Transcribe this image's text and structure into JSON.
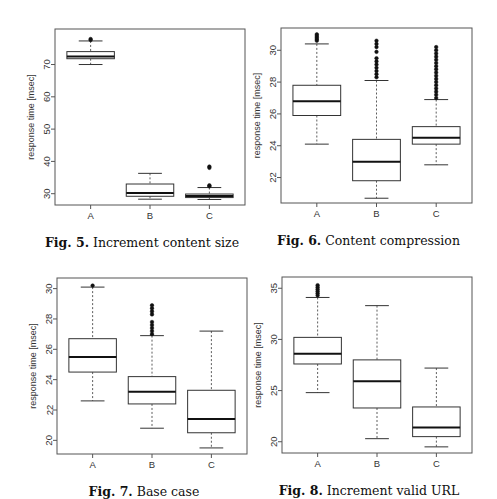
{
  "chart_data": [
    {
      "id": "fig5",
      "type": "box",
      "title": "Increment content size",
      "caption_label": "Fig. 5.",
      "caption_text": "Increment content size",
      "ylabel": "response time [msec]",
      "xlabel": "",
      "categories": [
        "A",
        "B",
        "C"
      ],
      "yticks": [
        30,
        40,
        50,
        60,
        70
      ],
      "ylim": [
        26.5,
        81
      ],
      "grid": false,
      "frame": {
        "x": 55,
        "y": 29,
        "w": 190,
        "h": 176
      },
      "boxes": [
        {
          "name": "A",
          "whisker_low": 70.0,
          "q1": 71.8,
          "median": 72.5,
          "q3": 74.0,
          "whisker_high": 77.3,
          "outliers": [
            77.6,
            77.9
          ]
        },
        {
          "name": "B",
          "whisker_low": 28.3,
          "q1": 29.2,
          "median": 30.2,
          "q3": 33.0,
          "whisker_high": 36.3,
          "outliers": []
        },
        {
          "name": "C",
          "whisker_low": 28.2,
          "q1": 28.8,
          "median": 29.3,
          "q3": 29.9,
          "whisker_high": 31.9,
          "outliers": [
            32.3,
            32.6,
            38.0,
            38.4
          ]
        }
      ]
    },
    {
      "id": "fig6",
      "type": "box",
      "title": "Content compression",
      "caption_label": "Fig. 6.",
      "caption_text": "Content compression",
      "ylabel": "response time [msec]",
      "xlabel": "",
      "categories": [
        "A",
        "B",
        "C"
      ],
      "yticks": [
        22,
        24,
        26,
        28,
        30
      ],
      "ylim": [
        20.4,
        31.4
      ],
      "grid": false,
      "frame": {
        "x": 281,
        "y": 28,
        "w": 191,
        "h": 175
      },
      "boxes": [
        {
          "name": "A",
          "whisker_low": 24.1,
          "q1": 25.9,
          "median": 26.8,
          "q3": 27.8,
          "whisker_high": 30.4,
          "outliers": [
            30.6,
            30.7,
            30.8,
            30.9,
            31.0
          ]
        },
        {
          "name": "B",
          "whisker_low": 20.7,
          "q1": 21.8,
          "median": 23.0,
          "q3": 24.4,
          "whisker_high": 28.1,
          "outliers": [
            28.3,
            28.5,
            28.7,
            28.9,
            29.1,
            29.3,
            29.5,
            29.9,
            30.2,
            30.4,
            30.6
          ]
        },
        {
          "name": "C",
          "whisker_low": 22.8,
          "q1": 24.1,
          "median": 24.5,
          "q3": 25.2,
          "whisker_high": 26.9,
          "outliers": [
            27.0,
            27.2,
            27.4,
            27.6,
            27.8,
            28.0,
            28.2,
            28.4,
            28.6,
            28.8,
            29.0,
            29.2,
            29.4,
            29.6,
            29.8,
            30.0,
            30.2
          ]
        }
      ]
    },
    {
      "id": "fig7",
      "type": "box",
      "title": "Base case",
      "caption_label": "Fig. 7.",
      "caption_text": "Base case",
      "ylabel": "response time [msec]",
      "xlabel": "",
      "categories": [
        "A",
        "B",
        "C"
      ],
      "yticks": [
        20,
        22,
        24,
        26,
        28,
        30
      ],
      "ylim": [
        19.1,
        30.7
      ],
      "grid": false,
      "frame": {
        "x": 57,
        "y": 278,
        "w": 190,
        "h": 176
      },
      "boxes": [
        {
          "name": "A",
          "whisker_low": 22.6,
          "q1": 24.5,
          "median": 25.5,
          "q3": 26.7,
          "whisker_high": 30.1,
          "outliers": [
            30.2
          ]
        },
        {
          "name": "B",
          "whisker_low": 20.8,
          "q1": 22.4,
          "median": 23.2,
          "q3": 24.2,
          "whisker_high": 26.9,
          "outliers": [
            27.0,
            27.2,
            27.4,
            27.6,
            27.8,
            28.3,
            28.5,
            28.7,
            28.9
          ]
        },
        {
          "name": "C",
          "whisker_low": 19.5,
          "q1": 20.5,
          "median": 21.4,
          "q3": 23.3,
          "whisker_high": 27.2,
          "outliers": []
        }
      ]
    },
    {
      "id": "fig8",
      "type": "box",
      "title": "Increment valid URL",
      "caption_label": "Fig. 8.",
      "caption_text": "Increment valid URL",
      "ylabel": "response time [msec]",
      "xlabel": "",
      "categories": [
        "A",
        "B",
        "C"
      ],
      "yticks": [
        20,
        25,
        30,
        35
      ],
      "ylim": [
        18.9,
        36.1
      ],
      "grid": false,
      "frame": {
        "x": 282,
        "y": 277,
        "w": 190,
        "h": 176
      },
      "boxes": [
        {
          "name": "A",
          "whisker_low": 24.8,
          "q1": 27.6,
          "median": 28.6,
          "q3": 30.2,
          "whisker_high": 34.1,
          "outliers": [
            34.3,
            34.5,
            34.7,
            34.9,
            35.1,
            35.3
          ]
        },
        {
          "name": "B",
          "whisker_low": 20.3,
          "q1": 23.3,
          "median": 25.9,
          "q3": 28.0,
          "whisker_high": 33.3,
          "outliers": []
        },
        {
          "name": "C",
          "whisker_low": 19.5,
          "q1": 20.5,
          "median": 21.4,
          "q3": 23.4,
          "whisker_high": 27.2,
          "outliers": []
        }
      ]
    }
  ],
  "style": {
    "box_stroke": "#333333",
    "median_stroke": "#111111",
    "frame_stroke": "#555555",
    "outlier_fill": "#111111",
    "text_color": "#333333"
  }
}
